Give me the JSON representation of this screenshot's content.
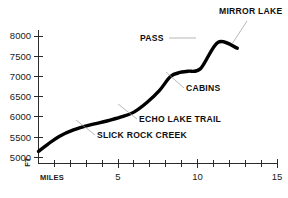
{
  "chart_data": {
    "type": "line",
    "title": "",
    "subtitle": "",
    "xlabel": "MILES",
    "ylabel": "FT",
    "xlim": [
      0,
      15
    ],
    "ylim": [
      4850,
      8150
    ],
    "grid": false,
    "legend_position": "none",
    "x_major_ticks": [
      5,
      10,
      15
    ],
    "x_major_tick_labels": [
      "5",
      "10",
      "15"
    ],
    "x_minor_ticks": [
      1,
      2,
      3,
      4,
      6,
      7,
      8,
      9,
      11,
      12,
      13,
      14
    ],
    "y_ticks": [
      5000,
      5500,
      6000,
      6500,
      7000,
      7500,
      8000
    ],
    "y_tick_labels": [
      "5000",
      "5500",
      "6000",
      "6500",
      "7000",
      "7500",
      "8000"
    ],
    "series": [
      {
        "name": "Trail elevation profile",
        "color": "#000000",
        "x": [
          0.0,
          0.6,
          1.3,
          2.2,
          3.2,
          4.3,
          5.2,
          6.0,
          6.8,
          7.6,
          8.3,
          8.9,
          9.4,
          10.2,
          11.3,
          12.5
        ],
        "y": [
          5150,
          5330,
          5520,
          5680,
          5800,
          5900,
          6000,
          6120,
          6350,
          6650,
          7000,
          7100,
          7130,
          7200,
          7850,
          7700
        ]
      }
    ],
    "annotations": [
      {
        "text": "MIRROR LAKE",
        "x": 12.5,
        "y": 7700,
        "label_x": 219,
        "label_y": 14,
        "leader": "M 247 21 L 232 44"
      },
      {
        "text": "PASS",
        "x": 10.2,
        "y": 7850,
        "label_x": 140,
        "label_y": 41,
        "leader": "M 169 38 L 196 38"
      },
      {
        "text": "CABINS",
        "x": 8.6,
        "y": 7100,
        "label_x": 186,
        "label_y": 91,
        "leader": "M 184 88 L 166 72"
      },
      {
        "text": "ECHO LAKE TRAIL",
        "x": 6.2,
        "y": 6200,
        "label_x": 139,
        "label_y": 122,
        "leader": "M 137 119 L 118 104"
      },
      {
        "text": "SLICK ROCK CREEK",
        "x": 3.4,
        "y": 5830,
        "label_x": 97,
        "label_y": 138,
        "leader": "M 95 135 L 76 120"
      }
    ]
  },
  "axis": {
    "x_name": "MILES",
    "y_name": "FT"
  }
}
